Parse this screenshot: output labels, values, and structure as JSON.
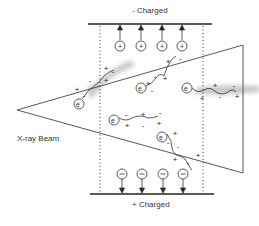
{
  "labels": {
    "top_plate": "- Charged",
    "bottom_plate": "+ Charged",
    "beam": "X-ray Beam"
  },
  "symbols": {
    "positive_ion": "+",
    "negative_ion": "−",
    "electron": "e⁻",
    "plus": "+",
    "minus": "-"
  },
  "colors": {
    "line": "#333333",
    "shadow": "#bfbfbf"
  }
}
